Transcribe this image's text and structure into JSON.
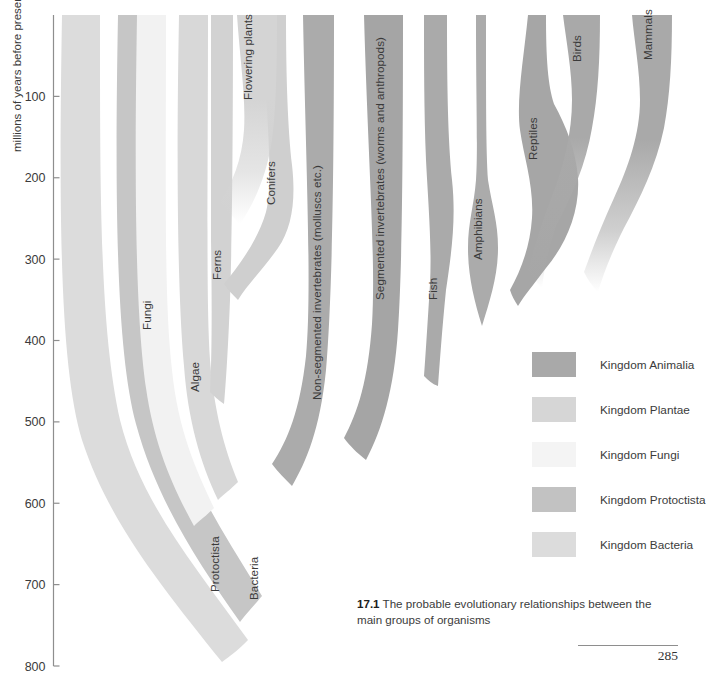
{
  "figure": {
    "caption_number": "17.1",
    "caption_text": "The probable evolutionary relationships between the main groups of organisms",
    "page_number": "285"
  },
  "axis": {
    "title": "millions of years before present",
    "tick_labels": [
      "100",
      "200",
      "300",
      "400",
      "500",
      "600",
      "700",
      "800"
    ],
    "tick_values": [
      100,
      200,
      300,
      400,
      500,
      600,
      700,
      800
    ],
    "range": [
      0,
      800
    ],
    "units": "millions of years before present",
    "direction": "increasing downward"
  },
  "legend": {
    "items": [
      {
        "label": "Kingdom Animalia",
        "color": "#a9a9a9"
      },
      {
        "label": "Kingdom Plantae",
        "color": "#d6d6d6"
      },
      {
        "label": "Kingdom Fungi",
        "color": "#f4f4f4"
      },
      {
        "label": "Kingdom Protoctista",
        "color": "#c2c2c2"
      },
      {
        "label": "Kingdom Bacteria",
        "color": "#dcdcdc"
      }
    ]
  },
  "branches": [
    {
      "name": "Bacteria",
      "label": "Bacteria",
      "kingdom": "Kingdom Bacteria",
      "color": "#dcdcdc",
      "origin_mya": 700,
      "label_x": 258,
      "label_y": 600
    },
    {
      "name": "Fungi",
      "label": "Fungi",
      "kingdom": "Kingdom Fungi",
      "color": "#f2f2f2",
      "origin_mya": 550,
      "label_x": 151,
      "label_y": 330
    },
    {
      "name": "Protoctista",
      "label": "Protoctista",
      "kingdom": "Kingdom Protoctista",
      "color": "#c6c6c6",
      "origin_mya": 680,
      "label_x": 219,
      "label_y": 592
    },
    {
      "name": "Algae",
      "label": "Algae",
      "kingdom": "Kingdom Plantae",
      "color": "#d8d8d8",
      "origin_mya": 520,
      "label_x": 199,
      "label_y": 392
    },
    {
      "name": "Ferns",
      "label": "Ferns",
      "kingdom": "Kingdom Plantae",
      "color": "#d2d2d2",
      "origin_mya": 400,
      "label_x": 221,
      "label_y": 280
    },
    {
      "name": "Conifers",
      "label": "Conifers",
      "kingdom": "Kingdom Plantae",
      "color": "#cfcfcf",
      "origin_mya": 300,
      "label_x": 275,
      "label_y": 205
    },
    {
      "name": "Flowering plants",
      "label": "Flowering plants",
      "kingdom": "Kingdom Plantae",
      "color": "#cdcdcd",
      "origin_mya": 200,
      "label_x": 252,
      "label_y": 100
    },
    {
      "name": "Non-segmented invertebrates",
      "label": "Non-segmented invertebrates (molluscs etc.)",
      "kingdom": "Kingdom Animalia",
      "color": "#ababab",
      "origin_mya": 600,
      "label_x": 321,
      "label_y": 400
    },
    {
      "name": "Segmented invertebrates",
      "label": "Segmented invertebrates (worms and anthropods)",
      "kingdom": "Kingdom Animalia",
      "color": "#a5a5a5",
      "origin_mya": 560,
      "label_x": 384,
      "label_y": 300
    },
    {
      "name": "Fish",
      "label": "Fish",
      "kingdom": "Kingdom Animalia",
      "color": "#aaaaaa",
      "origin_mya": 470,
      "label_x": 437,
      "label_y": 300
    },
    {
      "name": "Amphibians",
      "label": "Amphibians",
      "kingdom": "Kingdom Animalia",
      "color": "#ababab",
      "origin_mya": 400,
      "label_x": 482,
      "label_y": 260
    },
    {
      "name": "Reptiles",
      "label": "Reptiles",
      "kingdom": "Kingdom Animalia",
      "color": "#a6a6a6",
      "origin_mya": 340,
      "label_x": 537,
      "label_y": 160
    },
    {
      "name": "Birds",
      "label": "Birds",
      "kingdom": "Kingdom Animalia",
      "color": "#a3a3a3",
      "origin_mya": 200,
      "label_x": 581,
      "label_y": 62
    },
    {
      "name": "Mammals",
      "label": "Mammals",
      "kingdom": "Kingdom Animalia",
      "color": "#a8a8a8",
      "origin_mya": 220,
      "label_x": 652,
      "label_y": 60
    }
  ],
  "chart_data": {
    "type": "area",
    "title": "The probable evolutionary relationships between the main groups of organisms",
    "xlabel": "",
    "ylabel": "millions of years before present",
    "ylim": [
      0,
      800
    ],
    "y_ticks": [
      100,
      200,
      300,
      400,
      500,
      600,
      700,
      800
    ],
    "y_direction": "inverted (present at top, past at bottom)",
    "grid": false,
    "legend_position": "right-middle",
    "categories": [
      "Bacteria",
      "Protoctista",
      "Fungi",
      "Algae",
      "Ferns",
      "Conifers",
      "Flowering plants",
      "Non-segmented invertebrates (molluscs etc.)",
      "Segmented invertebrates (worms and anthropods)",
      "Fish",
      "Amphibians",
      "Reptiles",
      "Birds",
      "Mammals"
    ],
    "series": [
      {
        "name": "first appearance (millions of years before present)",
        "values": [
          700,
          680,
          550,
          520,
          400,
          300,
          200,
          600,
          560,
          470,
          400,
          340,
          200,
          220
        ]
      }
    ],
    "annotations": [
      "All lineages trace back to Bacteria at approximately 700 million years before present",
      "Protoctista gives rise to Fungi, Plantae (Algae, Ferns, Conifers, Flowering plants) and Animalia",
      "Animalia lineage: invertebrates give rise to Fish, then Amphibians, Reptiles, and finally Birds and Mammals"
    ]
  }
}
